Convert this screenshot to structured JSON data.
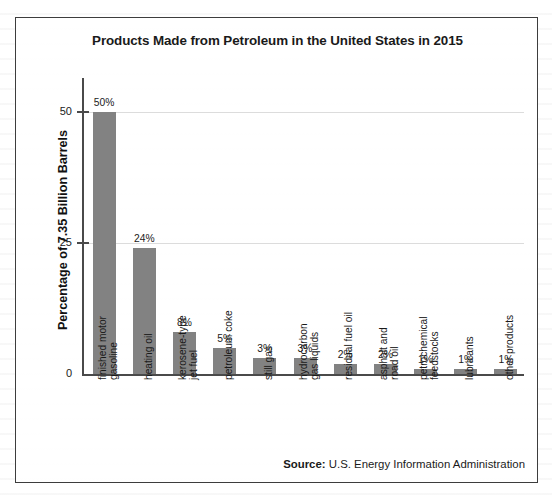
{
  "figure": {
    "title": "Products Made from Petroleum in the United States in 2015",
    "source_label": "Source:",
    "source_text": "U.S. Energy Information Administration",
    "bar_color": "#828282",
    "frame_color": "#3d3d3d",
    "gridline_color": "#dcdcdc"
  },
  "chart_data": {
    "type": "bar",
    "title": "Products Made from Petroleum in the United States in 2015",
    "xlabel": "",
    "ylabel": "Percentage of 7.35 Billion Barrels",
    "ylim": [
      0,
      55
    ],
    "yticks": [
      0,
      25,
      50
    ],
    "ytick_labels": [
      "0",
      "25",
      "50"
    ],
    "grid": true,
    "legend": "none",
    "categories": [
      "finished motor\ngasoline",
      "heating oil",
      "kerosene-type\njet fuel",
      "petroleum coke",
      "still gas",
      "hydrocarbon\ngas liquids",
      "residual fuel oil",
      "asphalt and\nroad oil",
      "petrochemical\nfeedstocks",
      "lubricants",
      "other products"
    ],
    "values": [
      50,
      24,
      8,
      5,
      3,
      3,
      2,
      2,
      1,
      1,
      1
    ],
    "data_labels": [
      "50%",
      "24%",
      "8%",
      "5%",
      "3%",
      "3%",
      "2%",
      "2%",
      "1%",
      "1%",
      "1%"
    ]
  }
}
